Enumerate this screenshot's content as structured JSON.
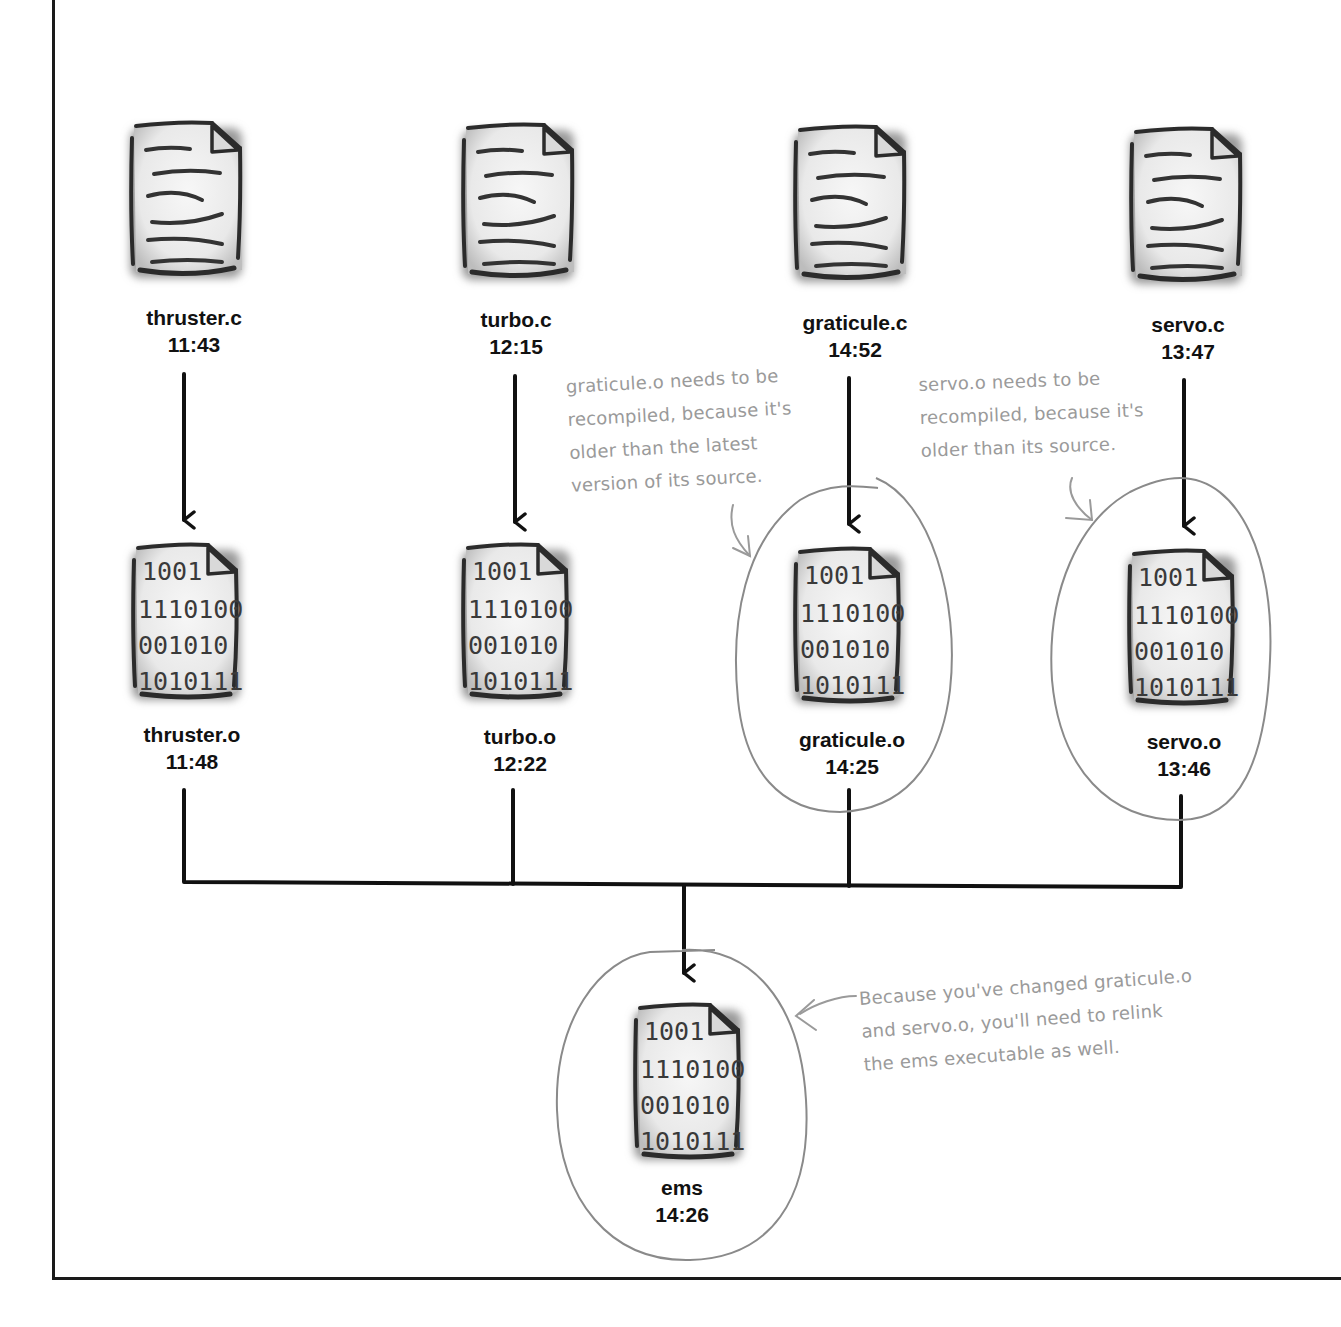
{
  "diagram": {
    "type": "dependency-graph",
    "sources": [
      {
        "name": "thruster.c",
        "time": "11:43"
      },
      {
        "name": "turbo.c",
        "time": "12:15"
      },
      {
        "name": "graticule.c",
        "time": "14:52"
      },
      {
        "name": "servo.c",
        "time": "13:47"
      }
    ],
    "objects": [
      {
        "name": "thruster.o",
        "time": "11:48",
        "needs_rebuild": false
      },
      {
        "name": "turbo.o",
        "time": "12:22",
        "needs_rebuild": false
      },
      {
        "name": "graticule.o",
        "time": "14:25",
        "needs_rebuild": true
      },
      {
        "name": "servo.o",
        "time": "13:46",
        "needs_rebuild": true
      }
    ],
    "executable": {
      "name": "ems",
      "time": "14:26",
      "needs_rebuild": true
    },
    "binary_icon_lines": [
      "1001",
      "1110100",
      "001010",
      "1010111"
    ],
    "annotations": {
      "graticule": "graticule.o needs to be\nrecompiled, because it's\nolder than the latest\nversion of its source.",
      "servo": "servo.o needs to be\nrecompiled, because it's\nolder than its source.",
      "ems": "Because you've changed graticule.o\nand servo.o, you'll need to relink\nthe ems executable as well."
    },
    "colors": {
      "ink": "#111111",
      "annotation": "#9a9a9a",
      "paper": "#f2f2f2"
    }
  }
}
